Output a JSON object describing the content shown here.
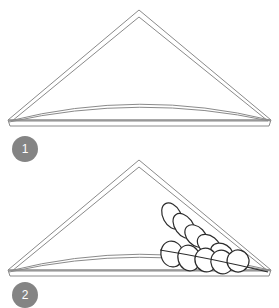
{
  "page": {
    "background_color": "#ffffff"
  },
  "style": {
    "outline_color": "#8a8a8a",
    "petal_outline_color": "#2b2b2b",
    "badge_color": "#848484",
    "badge_text_color": "#ffffff",
    "fill_color": "#ffffff"
  },
  "steps": [
    {
      "number": "1",
      "badge_label": "1",
      "figure_name": "folded-napkin-triangle",
      "description": "Triangle fold with curved swag",
      "elements": [
        "outer-triangle",
        "inner-triangle",
        "base-band",
        "arc-swag"
      ]
    },
    {
      "number": "2",
      "badge_label": "2",
      "figure_name": "folded-napkin-triangle-with-leaf-cluster",
      "description": "Triangle fold with fanned petal cluster at right corner",
      "elements": [
        "outer-triangle",
        "inner-triangle",
        "base-band",
        "arc-swag",
        "petal-fan"
      ]
    }
  ],
  "geometry": {
    "triangle": {
      "apex_x": 139,
      "apex_y": 10,
      "left_x": 8,
      "right_x": 271,
      "base_y": 124
    },
    "petal_count_upper": 5,
    "petal_count_lower": 5
  }
}
